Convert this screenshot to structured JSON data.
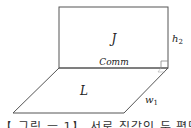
{
  "diagram": {
    "type": "3d-planes",
    "colors": {
      "stroke": "#555555",
      "text": "#222222",
      "background": "#ffffff"
    },
    "vertical_plane": {
      "label": "J",
      "x": 59,
      "y": 7,
      "width": 109,
      "height": 61
    },
    "horizontal_plane": {
      "label": "L",
      "points": [
        [
          59,
          68
        ],
        [
          168,
          68
        ],
        [
          124,
          113
        ],
        [
          13,
          113
        ]
      ]
    },
    "shared_edge_label": "Comm",
    "height_label": "h",
    "height_subscript": "2",
    "width_label": "w",
    "width_subscript": "1",
    "right_angle_marker": true
  },
  "caption_clipped": "【 그림 ㅡ 1】 서로 직각인 두 평면"
}
